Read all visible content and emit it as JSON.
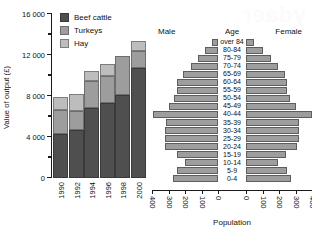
{
  "watermark_text": "ydaer",
  "chart_data": [
    {
      "type": "bar",
      "subtype": "stacked",
      "title": "",
      "xlabel": "",
      "ylabel": "Value of output (£)",
      "categories": [
        "1990",
        "1992",
        "1994",
        "1996",
        "1998",
        "2000"
      ],
      "ylim": [
        0,
        16000
      ],
      "yticks": [
        0,
        4000,
        8000,
        12000,
        16000
      ],
      "ytick_labels": [
        "0",
        "4 000",
        "8 000",
        "12 000",
        "16 000"
      ],
      "minor_ticks": [
        2000,
        6000,
        10000,
        14000
      ],
      "grid": false,
      "legend_position": "top-left",
      "series": [
        {
          "name": "Beef cattle",
          "color": "#4f4f4f",
          "values": [
            4300,
            4700,
            6800,
            7300,
            8100,
            10700
          ]
        },
        {
          "name": "Turkeys",
          "color": "#9d9d9d",
          "values": [
            2350,
            1800,
            2700,
            2700,
            3800,
            1700
          ]
        },
        {
          "name": "Hay",
          "color": "#bdbdbd",
          "values": [
            1250,
            1700,
            900,
            1100,
            0,
            1000
          ]
        }
      ],
      "totals": [
        7900,
        8200,
        10400,
        11100,
        11900,
        13400
      ]
    },
    {
      "type": "bar",
      "subtype": "population-pyramid",
      "title": "",
      "xlabel": "Population",
      "ylabel": "Age",
      "left_series_name": "Male",
      "right_series_name": "Female",
      "xlim": [
        0,
        400
      ],
      "xticks": [
        400,
        300,
        200,
        100,
        0,
        0,
        100,
        200,
        300,
        400
      ],
      "xtick_labels": [
        "400",
        "300",
        "200",
        "100",
        "0",
        "0",
        "100",
        "200",
        "300",
        "400"
      ],
      "grid": false,
      "categories": [
        "over 84",
        "80-84",
        "75-79",
        "70-74",
        "65-69",
        "60-64",
        "55-59",
        "50-54",
        "45-49",
        "40-44",
        "35-39",
        "30-34",
        "25-29",
        "20-24",
        "15-19",
        "10-14",
        "5-9",
        "0-4"
      ],
      "male": [
        35,
        80,
        120,
        165,
        215,
        250,
        250,
        265,
        300,
        395,
        315,
        320,
        320,
        320,
        250,
        200,
        250,
        270
      ],
      "female": [
        50,
        105,
        150,
        195,
        235,
        250,
        250,
        265,
        300,
        400,
        320,
        320,
        320,
        310,
        240,
        195,
        250,
        270
      ],
      "bar_color": "#9d9d9d"
    }
  ]
}
